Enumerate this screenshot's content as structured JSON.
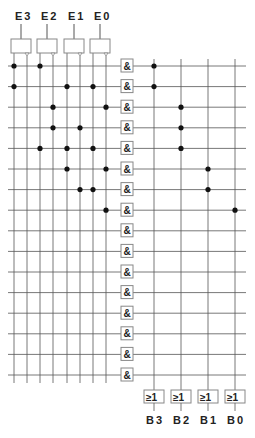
{
  "inputs": [
    {
      "label": "E3",
      "x": 14,
      "inv_x": 27
    },
    {
      "label": "E2",
      "x": 40,
      "inv_x": 53
    },
    {
      "label": "E1",
      "x": 67,
      "inv_x": 80
    },
    {
      "label": "E0",
      "x": 93,
      "inv_x": 106
    }
  ],
  "outputs": [
    {
      "label": "B3",
      "x": 154,
      "gate": "≥1"
    },
    {
      "label": "B2",
      "x": 181,
      "gate": "≥1"
    },
    {
      "label": "B1",
      "x": 208,
      "gate": "≥1"
    },
    {
      "label": "B0",
      "x": 235,
      "gate": "≥1"
    }
  ],
  "and_gate_label": "&",
  "row_count": 16,
  "row_start_y": 66,
  "row_spacing": 20.6,
  "rows": [
    {
      "input_dots": [
        14,
        40
      ],
      "output_dot": 154
    },
    {
      "input_dots": [
        14,
        67,
        93
      ],
      "output_dot": 154
    },
    {
      "input_dots": [
        53,
        106
      ],
      "output_dot": 181
    },
    {
      "input_dots": [
        53,
        80
      ],
      "output_dot": 181
    },
    {
      "input_dots": [
        40,
        67,
        93
      ],
      "output_dot": 181
    },
    {
      "input_dots": [
        67,
        106
      ],
      "output_dot": 208
    },
    {
      "input_dots": [
        80,
        93
      ],
      "output_dot": 208
    },
    {
      "input_dots": [
        106
      ],
      "output_dot": 235
    },
    {
      "input_dots": [],
      "output_dot": null
    },
    {
      "input_dots": [],
      "output_dot": null
    },
    {
      "input_dots": [],
      "output_dot": null
    },
    {
      "input_dots": [],
      "output_dot": null
    },
    {
      "input_dots": [],
      "output_dot": null
    },
    {
      "input_dots": [],
      "output_dot": null
    },
    {
      "input_dots": [],
      "output_dot": null
    },
    {
      "input_dots": [],
      "output_dot": null
    }
  ],
  "colors": {
    "line": "#555555",
    "dot": "#111111",
    "box_stroke": "#888888",
    "text": "#222222"
  }
}
